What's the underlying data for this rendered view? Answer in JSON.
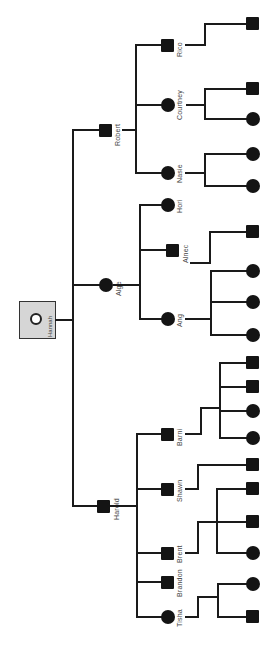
{
  "diagram": {
    "type": "family-tree",
    "orientation": "rotated-90-ccw",
    "colors": {
      "node_fill": "#141414",
      "root_fill": "#d6d6d6",
      "line": "#1a1a1a",
      "label": "#444444"
    },
    "root": {
      "name": "Hannah",
      "shape": "root-box"
    },
    "generation1": [
      {
        "name": "Robert",
        "shape": "square"
      },
      {
        "name": "Alge",
        "shape": "circle"
      },
      {
        "name": "Harold",
        "shape": "square"
      }
    ],
    "generation2": [
      {
        "name": "Rico",
        "shape": "square",
        "parent": "Robert"
      },
      {
        "name": "Courtney",
        "shape": "circle",
        "parent": "Robert"
      },
      {
        "name": "Nasie",
        "shape": "circle",
        "parent": "Robert"
      },
      {
        "name": "Hori",
        "shape": "circle",
        "parent": "Alge"
      },
      {
        "name": "Alnec",
        "shape": "square",
        "parent": "Alge"
      },
      {
        "name": "Ang",
        "shape": "circle",
        "parent": "Alge"
      },
      {
        "name": "Barni",
        "shape": "square",
        "parent": "Harold"
      },
      {
        "name": "Shawn",
        "shape": "square",
        "parent": "Harold"
      },
      {
        "name": "Brent",
        "shape": "square",
        "parent": "Harold"
      },
      {
        "name": "Brandon",
        "shape": "square",
        "parent": "Harold"
      },
      {
        "name": "Tisha",
        "shape": "circle",
        "parent": "Harold"
      }
    ],
    "generation3": [
      {
        "shape": "square",
        "parent": "Rico"
      },
      {
        "shape": "square",
        "parent": "Courtney"
      },
      {
        "shape": "circle",
        "parent": "Courtney"
      },
      {
        "shape": "circle",
        "parent": "Nasie"
      },
      {
        "shape": "circle",
        "parent": "Nasie"
      },
      {
        "shape": "square",
        "parent": "Alnec"
      },
      {
        "shape": "circle",
        "parent": "Ang"
      },
      {
        "shape": "circle",
        "parent": "Ang"
      },
      {
        "shape": "circle",
        "parent": "Ang"
      },
      {
        "shape": "square",
        "parent": "Barni"
      },
      {
        "shape": "square",
        "parent": "Barni"
      },
      {
        "shape": "circle",
        "parent": "Barni"
      },
      {
        "shape": "circle",
        "parent": "Barni"
      },
      {
        "shape": "square",
        "parent": "Shawn"
      },
      {
        "shape": "square",
        "parent": "Brent"
      },
      {
        "shape": "square",
        "parent": "Brent"
      },
      {
        "shape": "circle",
        "parent": "Brent"
      },
      {
        "shape": "circle",
        "parent": "Tisha"
      },
      {
        "shape": "square",
        "parent": "Tisha"
      }
    ]
  }
}
